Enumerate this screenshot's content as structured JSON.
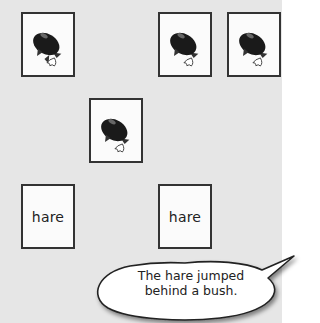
{
  "board": {
    "background_color": "#e6e6e6",
    "cards": [
      {
        "id": 1,
        "face": "rocket-image",
        "label": ""
      },
      {
        "id": 2,
        "face": "rocket-image",
        "label": ""
      },
      {
        "id": 3,
        "face": "rocket-image",
        "label": ""
      },
      {
        "id": 4,
        "face": "rocket-image",
        "label": ""
      },
      {
        "id": 5,
        "face": "word",
        "label": "hare"
      },
      {
        "id": 6,
        "face": "word",
        "label": "hare"
      }
    ]
  },
  "speech_bubble": {
    "line1": "The hare jumped",
    "line2": "behind a bush."
  }
}
